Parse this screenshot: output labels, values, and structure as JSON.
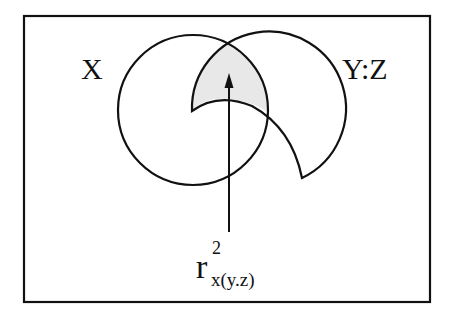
{
  "diagram": {
    "type": "venn",
    "labels": {
      "left_circle": "X",
      "right_circle": "Y:Z"
    },
    "annotation": {
      "base": "r",
      "superscript": "2",
      "subscript": "x(y.z)"
    },
    "colors": {
      "stroke": "#111111",
      "shaded_region": "#e8e8e8",
      "background": "#ffffff"
    }
  }
}
